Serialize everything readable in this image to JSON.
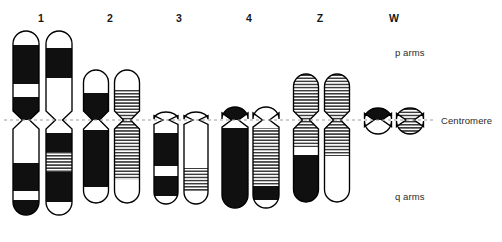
{
  "figure": {
    "type": "karyotype-ideogram",
    "width": 502,
    "height": 242,
    "background": "#ffffff",
    "outline_color": "#000000",
    "band_dark_color": "#101010",
    "band_light_color": "#ffffff",
    "band_hatch_color": "#3c3c3c",
    "centromere_line_color": "#9a9a9a"
  },
  "annotations": {
    "p_arms": "p arms",
    "centromere": "Centromere",
    "q_arms": "q arms"
  },
  "centromere_line": {
    "y": 120,
    "x_start": 4,
    "x_end": 436,
    "style": "dashed"
  },
  "chart_data": {
    "type": "diagram",
    "title": "",
    "xlabel": "",
    "ylabel": "",
    "categories": [
      "1",
      "2",
      "3",
      "4",
      "Z",
      "W"
    ],
    "legend": [
      "p arms",
      "Centromere",
      "q arms"
    ]
  },
  "chromosomes": [
    {
      "label": "1",
      "label_x": 41,
      "label_y": 12,
      "width": 26,
      "pinch": 7,
      "homologues": [
        {
          "name": "chromosome-1-homologue-a",
          "cx": 26,
          "p_top": 31,
          "q_bottom": 215,
          "p_bands": [
            {
              "from": 31,
              "to": 45,
              "fill": "light"
            },
            {
              "from": 45,
              "to": 84,
              "fill": "dark"
            },
            {
              "from": 84,
              "to": 97,
              "fill": "light"
            },
            {
              "from": 97,
              "to": 120,
              "fill": "dark"
            }
          ],
          "q_bands": [
            {
              "from": 120,
              "to": 163,
              "fill": "light"
            },
            {
              "from": 163,
              "to": 191,
              "fill": "dark"
            },
            {
              "from": 191,
              "to": 200,
              "fill": "light"
            },
            {
              "from": 200,
              "to": 215,
              "fill": "dark"
            }
          ]
        },
        {
          "name": "chromosome-1-homologue-b",
          "cx": 59,
          "p_top": 31,
          "q_bottom": 215,
          "p_bands": [
            {
              "from": 31,
              "to": 48,
              "fill": "light"
            },
            {
              "from": 48,
              "to": 78,
              "fill": "dark"
            },
            {
              "from": 78,
              "to": 120,
              "fill": "light"
            }
          ],
          "q_bands": [
            {
              "from": 120,
              "to": 133,
              "fill": "light"
            },
            {
              "from": 133,
              "to": 152,
              "fill": "dark"
            },
            {
              "from": 152,
              "to": 172,
              "fill": "hatch"
            },
            {
              "from": 172,
              "to": 202,
              "fill": "dark"
            },
            {
              "from": 202,
              "to": 215,
              "fill": "light"
            }
          ]
        }
      ]
    },
    {
      "label": "2",
      "label_x": 110,
      "label_y": 12,
      "width": 25,
      "pinch": 7,
      "homologues": [
        {
          "name": "chromosome-2-homologue-a",
          "cx": 96,
          "p_top": 70,
          "q_bottom": 203,
          "p_bands": [
            {
              "from": 70,
              "to": 93,
              "fill": "light"
            },
            {
              "from": 93,
              "to": 120,
              "fill": "dark"
            }
          ],
          "q_bands": [
            {
              "from": 120,
              "to": 130,
              "fill": "light"
            },
            {
              "from": 130,
              "to": 187,
              "fill": "dark"
            },
            {
              "from": 187,
              "to": 203,
              "fill": "light"
            }
          ]
        },
        {
          "name": "chromosome-2-homologue-b",
          "cx": 127,
          "p_top": 70,
          "q_bottom": 203,
          "p_bands": [
            {
              "from": 70,
              "to": 90,
              "fill": "light"
            },
            {
              "from": 90,
              "to": 120,
              "fill": "hatch"
            }
          ],
          "q_bands": [
            {
              "from": 120,
              "to": 180,
              "fill": "hatch"
            },
            {
              "from": 180,
              "to": 203,
              "fill": "light"
            }
          ]
        }
      ]
    },
    {
      "label": "3",
      "label_x": 179,
      "label_y": 12,
      "width": 24,
      "pinch": 6,
      "homologues": [
        {
          "name": "chromosome-3-homologue-a",
          "cx": 166,
          "p_top": 112,
          "q_bottom": 204,
          "p_bands": [
            {
              "from": 112,
              "to": 120,
              "fill": "light"
            }
          ],
          "q_bands": [
            {
              "from": 120,
              "to": 133,
              "fill": "light"
            },
            {
              "from": 133,
              "to": 166,
              "fill": "dark"
            },
            {
              "from": 166,
              "to": 176,
              "fill": "light"
            },
            {
              "from": 176,
              "to": 196,
              "fill": "dark"
            },
            {
              "from": 196,
              "to": 204,
              "fill": "light"
            }
          ]
        },
        {
          "name": "chromosome-3-homologue-b",
          "cx": 196,
          "p_top": 112,
          "q_bottom": 204,
          "p_bands": [
            {
              "from": 112,
              "to": 120,
              "fill": "light"
            }
          ],
          "q_bands": [
            {
              "from": 120,
              "to": 168,
              "fill": "light"
            },
            {
              "from": 168,
              "to": 192,
              "fill": "hatch"
            },
            {
              "from": 192,
              "to": 204,
              "fill": "light"
            }
          ]
        }
      ]
    },
    {
      "label": "4",
      "label_x": 249,
      "label_y": 12,
      "width": 26,
      "pinch": 7,
      "homologues": [
        {
          "name": "chromosome-4-homologue-a",
          "cx": 235,
          "p_top": 107,
          "q_bottom": 208,
          "p_bands": [
            {
              "from": 107,
              "to": 120,
              "fill": "dark"
            }
          ],
          "q_bands": [
            {
              "from": 120,
              "to": 128,
              "fill": "light"
            },
            {
              "from": 128,
              "to": 208,
              "fill": "dark"
            }
          ]
        },
        {
          "name": "chromosome-4-homologue-b",
          "cx": 266,
          "p_top": 107,
          "q_bottom": 208,
          "p_bands": [
            {
              "from": 107,
              "to": 120,
              "fill": "light"
            }
          ],
          "q_bands": [
            {
              "from": 120,
              "to": 128,
              "fill": "light"
            },
            {
              "from": 128,
              "to": 186,
              "fill": "hatch"
            },
            {
              "from": 186,
              "to": 200,
              "fill": "dark"
            },
            {
              "from": 200,
              "to": 208,
              "fill": "light"
            }
          ]
        }
      ]
    },
    {
      "label": "Z",
      "label_x": 320,
      "label_y": 12,
      "width": 25,
      "pinch": 7,
      "homologues": [
        {
          "name": "chromosome-z-homologue-a",
          "cx": 306,
          "p_top": 74,
          "q_bottom": 202,
          "p_bands": [
            {
              "from": 74,
              "to": 120,
              "fill": "hatch"
            }
          ],
          "q_bands": [
            {
              "from": 120,
              "to": 147,
              "fill": "hatch"
            },
            {
              "from": 147,
              "to": 155,
              "fill": "light"
            },
            {
              "from": 155,
              "to": 202,
              "fill": "dark"
            }
          ]
        },
        {
          "name": "chromosome-z-homologue-b",
          "cx": 337,
          "p_top": 74,
          "q_bottom": 202,
          "p_bands": [
            {
              "from": 74,
              "to": 120,
              "fill": "hatch"
            }
          ],
          "q_bands": [
            {
              "from": 120,
              "to": 156,
              "fill": "hatch"
            },
            {
              "from": 156,
              "to": 202,
              "fill": "light"
            }
          ]
        }
      ]
    },
    {
      "label": "W",
      "label_x": 394,
      "label_y": 12,
      "width": 27,
      "pinch": 8,
      "homologues": [
        {
          "name": "chromosome-w-homologue-a",
          "cx": 378,
          "p_top": 108,
          "q_bottom": 134,
          "p_bands": [
            {
              "from": 108,
              "to": 120,
              "fill": "dark"
            }
          ],
          "q_bands": [
            {
              "from": 120,
              "to": 134,
              "fill": "light"
            }
          ]
        },
        {
          "name": "chromosome-w-homologue-b",
          "cx": 410,
          "p_top": 108,
          "q_bottom": 134,
          "p_bands": [
            {
              "from": 108,
              "to": 120,
              "fill": "hatch"
            }
          ],
          "q_bands": [
            {
              "from": 120,
              "to": 134,
              "fill": "hatch"
            }
          ]
        }
      ]
    }
  ]
}
